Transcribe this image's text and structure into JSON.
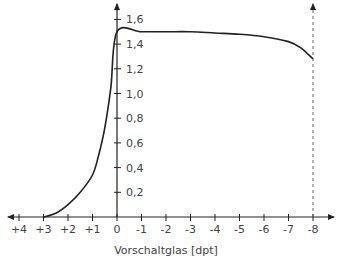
{
  "chart_data": {
    "type": "line",
    "title": "",
    "xlabel": "Vorschaltglas [dpt]",
    "ylabel": "",
    "x_ticks": [
      "+4",
      "+3",
      "+2",
      "+1",
      "0",
      "-1",
      "-2",
      "-3",
      "-4",
      "-5",
      "-6",
      "-7",
      "-8"
    ],
    "y_ticks": [
      "0,2",
      "0,4",
      "0,6",
      "0,8",
      "1,0",
      "1,2",
      "1,4",
      "1,6"
    ],
    "xlim": [
      4,
      -8
    ],
    "ylim": [
      0,
      1.65
    ],
    "grid": false,
    "legend": null,
    "annotations": [
      {
        "type": "dashed-vertical-line",
        "x": -8
      }
    ],
    "series": [
      {
        "name": "curve",
        "x": [
          3,
          2.5,
          2,
          1.5,
          1,
          0.75,
          0.5,
          0.25,
          0,
          -1,
          -2,
          -3,
          -4,
          -5,
          -6,
          -7,
          -7.5,
          -8
        ],
        "y": [
          0.0,
          0.03,
          0.1,
          0.2,
          0.34,
          0.5,
          0.72,
          1.05,
          1.5,
          1.5,
          1.5,
          1.5,
          1.49,
          1.48,
          1.46,
          1.42,
          1.37,
          1.28
        ]
      }
    ]
  }
}
